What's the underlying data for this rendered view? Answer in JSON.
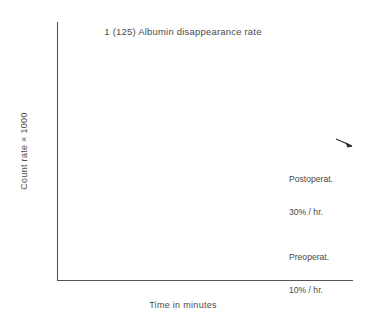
{
  "chart_data": {
    "type": "line",
    "title": "1 (125) Albumin disappearance rate",
    "xlabel": "Time in minutes",
    "ylabel": "Count rate × 1000",
    "xlim": [
      0,
      25
    ],
    "ylim": [
      2.0,
      5.0
    ],
    "yscale": "log",
    "grid": false,
    "legend": "annotations-inline",
    "xticks": [
      5,
      10,
      15,
      20,
      25
    ],
    "xtick_labels": [
      "5",
      "10",
      "15",
      "20",
      "25"
    ],
    "yticks": [
      2.0,
      3.0,
      4.0,
      5.0
    ],
    "ytick_labels": [
      "2.0",
      "3.0",
      "4.0",
      "5.0"
    ],
    "yminor_ticks": [
      2.5,
      3.5,
      4.5
    ],
    "marker": "triangle",
    "series": [
      {
        "name": "Postoperat.",
        "rate_label": "30% / hr.",
        "annotation": [
          "Postoperat.",
          "30% / hr."
        ],
        "x": [
          5,
          10,
          15,
          20,
          25
        ],
        "values": [
          3.78,
          3.67,
          3.5,
          3.38,
          3.24
        ],
        "extrapolated_intercept_x": 0,
        "extrapolated_intercept_y": 3.88,
        "extrapolation_style": "dashed"
      },
      {
        "name": "Preoperat.",
        "rate_label": "10% / hr.",
        "annotation": [
          "Preoperat.",
          "10% / hr."
        ],
        "x": [
          5,
          10,
          15,
          20,
          25
        ],
        "values": [
          2.66,
          2.64,
          2.63,
          2.61,
          2.59
        ],
        "extrapolated_intercept_x": 0,
        "extrapolated_intercept_y": 2.67,
        "extrapolation_style": "dashed"
      }
    ]
  },
  "colors": {
    "ink": "#2b2b2b",
    "text": "#4a4a4a",
    "axis": "#555555",
    "background": "#ffffff"
  },
  "annotations": {
    "postoperative_line1": "Postoperat.",
    "postoperative_line2": "30% / hr.",
    "preoperative_line1": "Preoperat.",
    "preoperative_line2": "10% / hr."
  }
}
